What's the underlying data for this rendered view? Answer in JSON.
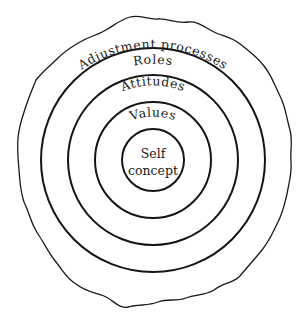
{
  "diagram": {
    "type": "concentric-layers",
    "center": [
      153,
      159
    ],
    "layers": [
      {
        "id": "self-concept",
        "label_lines": [
          "Self",
          "concept"
        ],
        "radius": 31
      },
      {
        "id": "values",
        "label": "Values",
        "radius": 58
      },
      {
        "id": "attitudes",
        "label": "Attitudes",
        "radius": 85
      },
      {
        "id": "roles",
        "label": "Roles",
        "radius": 112
      },
      {
        "id": "adjustment-processes",
        "label": "Adjustment processes",
        "boundary": "irregular"
      }
    ],
    "labels": {
      "self": "Self",
      "concept": "concept",
      "values": "Values",
      "attitudes": "Attitudes",
      "roles": "Roles",
      "adjustment": "Adjustment processes"
    },
    "colors": {
      "line": "#151515",
      "background": "#ffffff"
    }
  }
}
